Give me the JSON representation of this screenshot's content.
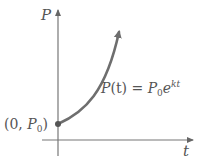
{
  "diagram": {
    "axes": {
      "y_label": "P",
      "x_label": "t"
    },
    "point": {
      "label_open": "(0, ",
      "label_var": "P",
      "label_sub": "0",
      "label_close": ")"
    },
    "equation": {
      "lhs_var": "P",
      "lhs_arg": "(t)",
      "equals": " = ",
      "rhs_var": "P",
      "rhs_sub": "0",
      "rhs_base": "e",
      "rhs_exp": "kt"
    },
    "colors": {
      "axis": "#777777",
      "curve": "#6e6e6e",
      "point": "#555555",
      "text": "#555555"
    }
  }
}
